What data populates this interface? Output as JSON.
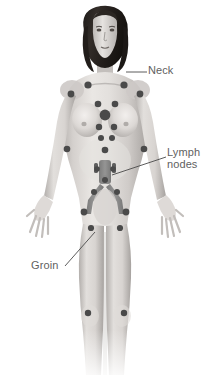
{
  "figure": {
    "background_color": "#ffffff",
    "width": 218,
    "height": 383
  },
  "labels": [
    {
      "id": "neck",
      "text": "Neck",
      "color": "#5f5f5f",
      "x": 148,
      "y": 65,
      "leader": {
        "from_x": 126,
        "from_y": 72,
        "to_x": 147,
        "to_y": 72
      }
    },
    {
      "id": "lymph-nodes",
      "text_line1": "Lymph",
      "text_line2": "nodes",
      "color": "#5f5f5f",
      "x": 167,
      "y": 147,
      "leader": {
        "from_x": 112,
        "from_y": 175,
        "to_x": 166,
        "to_y": 157
      }
    },
    {
      "id": "groin",
      "text": "Groin",
      "color": "#5f5f5f",
      "x": 31,
      "y": 260,
      "leader": {
        "from_x": 65,
        "from_y": 266,
        "to_x": 95,
        "to_y": 232
      }
    }
  ],
  "palette": {
    "node_fill": "#4a4a4a",
    "node_fill_dark": "#3d3d3d",
    "vessel_fill": "#7c7c7c",
    "skin_light": "#e7e4e1",
    "skin_mid": "#c9c5c2",
    "skin_shadow": "#a9a5a2",
    "hair_dark": "#2a2522",
    "leader_line": "#4a4a4a",
    "label_text": "#5f5f5f"
  },
  "anatomy": {
    "hair": "dark shoulder-length wavy hair",
    "icon_names": [
      "lymph-node-dot",
      "lymph-vessel-trunk",
      "leader-line"
    ],
    "node_groups": [
      {
        "name": "cervical-left",
        "cx": 88,
        "cy": 85,
        "r": 3.6
      },
      {
        "name": "cervical-right",
        "cx": 124,
        "cy": 85,
        "r": 3.6
      },
      {
        "name": "axillary-left",
        "cx": 71,
        "cy": 94,
        "r": 3.4
      },
      {
        "name": "axillary-right",
        "cx": 140,
        "cy": 94,
        "r": 3.4
      },
      {
        "name": "supraclavicular-left",
        "cx": 98,
        "cy": 104,
        "r": 3.3
      },
      {
        "name": "supraclavicular-right",
        "cx": 115,
        "cy": 104,
        "r": 3.3
      },
      {
        "name": "mediastinal-central",
        "cx": 105,
        "cy": 115,
        "r": 5.4
      },
      {
        "name": "internal-mammary-left",
        "cx": 99,
        "cy": 127,
        "r": 3.2
      },
      {
        "name": "internal-mammary-right",
        "cx": 114,
        "cy": 127,
        "r": 3.2
      },
      {
        "name": "epigastric-left",
        "cx": 101,
        "cy": 138,
        "r": 3.0
      },
      {
        "name": "epigastric-right",
        "cx": 112,
        "cy": 138,
        "r": 3.0
      },
      {
        "name": "upper-abdominal",
        "cx": 105,
        "cy": 150,
        "r": 3.3
      },
      {
        "name": "brachial-left",
        "cx": 67,
        "cy": 149,
        "r": 3.3
      },
      {
        "name": "brachial-right",
        "cx": 144,
        "cy": 149,
        "r": 3.3
      },
      {
        "name": "para-aortic-upper-left",
        "cx": 97,
        "cy": 169,
        "r": 2.8
      },
      {
        "name": "para-aortic-upper-right",
        "cx": 113,
        "cy": 169,
        "r": 2.8
      },
      {
        "name": "para-aortic-mid",
        "cx": 105,
        "cy": 180,
        "r": 3.0
      },
      {
        "name": "iliac-left",
        "cx": 94,
        "cy": 192,
        "r": 3.0
      },
      {
        "name": "iliac-right",
        "cx": 117,
        "cy": 192,
        "r": 3.0
      },
      {
        "name": "inguinal-left",
        "cx": 84,
        "cy": 212,
        "r": 3.4
      },
      {
        "name": "inguinal-right",
        "cx": 126,
        "cy": 212,
        "r": 3.4
      },
      {
        "name": "femoral-left",
        "cx": 91,
        "cy": 228,
        "r": 3.1
      },
      {
        "name": "femoral-right",
        "cx": 120,
        "cy": 228,
        "r": 3.1
      },
      {
        "name": "popliteal-left",
        "cx": 88,
        "cy": 313,
        "r": 3.2
      },
      {
        "name": "popliteal-right",
        "cx": 124,
        "cy": 313,
        "r": 3.2
      }
    ]
  }
}
